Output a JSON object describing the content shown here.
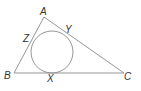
{
  "diagram": {
    "type": "triangle-with-incircle",
    "colors": {
      "line": "#8a8a8a",
      "text": "#333333",
      "background": "#ffffff"
    },
    "vertices": [
      {
        "label": "A",
        "x": 44,
        "y": 17
      },
      {
        "label": "B",
        "x": 14,
        "y": 73
      },
      {
        "label": "C",
        "x": 124,
        "y": 73
      }
    ],
    "tangent_points": [
      {
        "label": "X",
        "side": "BC"
      },
      {
        "label": "Y",
        "side": "AC"
      },
      {
        "label": "Z",
        "side": "AB"
      }
    ],
    "incircle": {
      "cx": 52,
      "cy": 52,
      "r": 21
    }
  }
}
